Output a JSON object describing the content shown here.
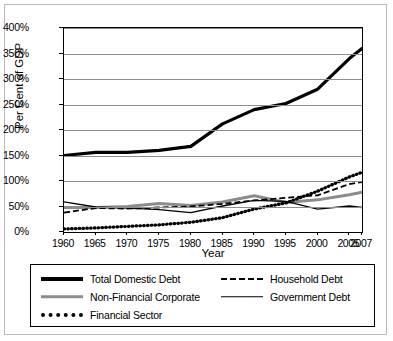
{
  "chart_data": {
    "type": "line",
    "title": "",
    "xlabel": "Year",
    "ylabel": "Per Cent of GDP",
    "grid": "horizontal",
    "legend_position": "bottom",
    "xlim": [
      1960,
      2007
    ],
    "ylim": [
      0,
      400
    ],
    "ytick_labels": [
      "400%",
      "350%",
      "300%",
      "250%",
      "200%",
      "150%",
      "100%",
      "50%",
      "0%"
    ],
    "ytick_values": [
      400,
      350,
      300,
      250,
      200,
      150,
      100,
      50,
      0
    ],
    "xtick_labels": [
      "1960",
      "1965",
      "1970",
      "1975",
      "1980",
      "1985",
      "1990",
      "1995",
      "2000",
      "2005",
      "2007"
    ],
    "xtick_values": [
      1960,
      1965,
      1970,
      1975,
      1980,
      1985,
      1990,
      1995,
      2000,
      2005,
      2007
    ],
    "x": [
      1960,
      1965,
      1970,
      1975,
      1980,
      1985,
      1990,
      1995,
      2000,
      2005,
      2007
    ],
    "series": [
      {
        "name": "Total Domestic Debt",
        "style": "solid-thick-black",
        "color": "#000000",
        "values": [
          150,
          156,
          156,
          160,
          168,
          212,
          240,
          252,
          280,
          340,
          360
        ]
      },
      {
        "name": "Household Debt",
        "style": "dashed-black",
        "color": "#000000",
        "values": [
          38,
          47,
          46,
          48,
          50,
          55,
          62,
          67,
          72,
          94,
          98
        ]
      },
      {
        "name": "Non-Financial Corporate",
        "style": "solid-thick-gray",
        "color": "#8c8c8c",
        "values": [
          48,
          48,
          50,
          56,
          52,
          59,
          71,
          58,
          63,
          73,
          78
        ]
      },
      {
        "name": "Government Debt",
        "style": "solid-thin-black",
        "color": "#000000",
        "values": [
          59,
          49,
          47,
          44,
          38,
          51,
          62,
          60,
          45,
          51,
          48
        ]
      },
      {
        "name": "Financial Sector",
        "style": "dotted-black",
        "color": "#000000",
        "values": [
          6,
          8,
          11,
          14,
          19,
          28,
          45,
          57,
          80,
          108,
          117
        ]
      }
    ]
  },
  "legend": {
    "entries": [
      {
        "label": "Total Domestic Debt"
      },
      {
        "label": "Household Debt"
      },
      {
        "label": "Non-Financial Corporate"
      },
      {
        "label": "Government Debt"
      },
      {
        "label": "Financial Sector"
      }
    ]
  }
}
